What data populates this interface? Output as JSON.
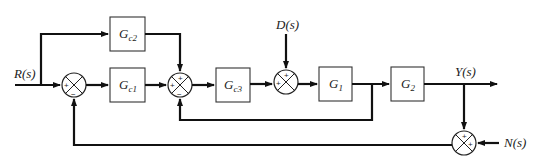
{
  "diagram": {
    "type": "control-system-block-diagram",
    "signals": {
      "input": "R(s)",
      "disturbance": "D(s)",
      "output": "Y(s)",
      "noise": "N(s)"
    },
    "blocks": [
      {
        "id": "gc1",
        "main": "G",
        "sub": "c1"
      },
      {
        "id": "gc2",
        "main": "G",
        "sub": "c2"
      },
      {
        "id": "gc3",
        "main": "G",
        "sub": "c3"
      },
      {
        "id": "g1",
        "main": "G",
        "sub": "1"
      },
      {
        "id": "g2",
        "main": "G",
        "sub": "2"
      }
    ],
    "summing_junctions": [
      {
        "id": "sum1",
        "signs": {
          "left": "+",
          "bottom": "−"
        }
      },
      {
        "id": "sum2",
        "signs": {
          "top": "+",
          "left": "+",
          "bottom": "−"
        }
      },
      {
        "id": "sum3",
        "signs": {
          "top": "+",
          "left": "+"
        }
      },
      {
        "id": "sum4",
        "signs": {
          "top": "+",
          "right": "+"
        }
      }
    ],
    "connections": [
      "R(s) → sum1(+)",
      "R(s) → Gc2",
      "sum1 → Gc1",
      "Gc1 → sum2(+ left)",
      "Gc2 → sum2(+ top)",
      "sum2 → Gc3",
      "Gc3 → sum3(+ left)",
      "D(s) → sum3(+ top)",
      "sum3 → G1",
      "G1 → G2",
      "G1 output → sum2(− bottom)",
      "G2 → Y(s)",
      "Y(s) → sum4(+ top)",
      "N(s) → sum4(+ right)",
      "sum4 → sum1(− bottom)"
    ]
  }
}
